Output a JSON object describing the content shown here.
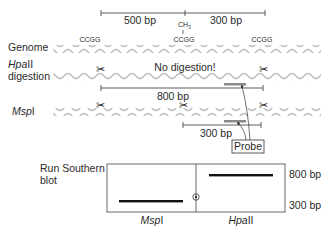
{
  "scale_top": {
    "left_label": "500 bp",
    "right_label": "300 bp",
    "methyl_label": "CH3",
    "methyl_sub": "3"
  },
  "sites": {
    "label": "CCGG",
    "count": 3
  },
  "rows": {
    "genome": {
      "label": "Genome"
    },
    "hpaii": {
      "label_enzyme": "Hpa",
      "label_enzyme_suffix": "II",
      "label_line2": "digestion",
      "note": "No digestion!",
      "fragment_label": "800 bp"
    },
    "mspi": {
      "label_enzyme": "Msp",
      "label_enzyme_suffix": "I",
      "fragment_label": "300 bp"
    }
  },
  "probe": {
    "label": "Probe"
  },
  "blot": {
    "title_line1": "Run Southern",
    "title_line2": "blot",
    "lanes": [
      {
        "enzyme": "Msp",
        "suffix": "I",
        "band": "300 bp"
      },
      {
        "enzyme": "Hpa",
        "suffix": "II",
        "band": "800 bp"
      }
    ],
    "size_markers": [
      "800 bp",
      "300 bp"
    ]
  },
  "colors": {
    "dna_wave": "#bdbdbd",
    "line": "#333333",
    "probe_bar": "#8a8a8a",
    "band": "#111111"
  }
}
